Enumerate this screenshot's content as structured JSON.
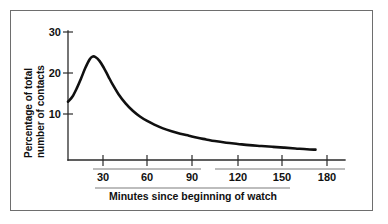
{
  "chart_data": {
    "type": "line",
    "title": "",
    "subtitle": "",
    "xlabel": "Minutes since beginning of watch",
    "ylabel": "Percentage of total number of contacts",
    "ylabel_line1": "Percentage of total",
    "ylabel_line2": "number of contacts",
    "xlim": [
      0,
      195
    ],
    "ylim": [
      0,
      30
    ],
    "grid": false,
    "legend": null,
    "legend_position": "none",
    "x_ticks": [
      30,
      60,
      90,
      120,
      150,
      180
    ],
    "x_tick_labels": [
      "30",
      "60",
      "90",
      "120",
      "150",
      "180"
    ],
    "y_ticks": [
      10,
      20,
      30
    ],
    "y_tick_labels": [
      "10",
      "20",
      "30"
    ],
    "series": [
      {
        "name": "Percentage of total number of contacts",
        "color": "#101010",
        "x": [
          0,
          3,
          6,
          9,
          12,
          15,
          17,
          19,
          22,
          25,
          28,
          31,
          35,
          40,
          45,
          50,
          55,
          60,
          66,
          72,
          78,
          84,
          90,
          96,
          102,
          110,
          118,
          126,
          134,
          142,
          150,
          158,
          166,
          172
        ],
        "values": [
          13.0,
          14.2,
          16.2,
          18.6,
          21.2,
          23.3,
          24.0,
          23.9,
          22.9,
          21.2,
          19.2,
          17.2,
          14.9,
          12.6,
          10.8,
          9.4,
          8.3,
          7.4,
          6.5,
          5.8,
          5.2,
          4.7,
          4.2,
          3.8,
          3.4,
          3.0,
          2.7,
          2.4,
          2.2,
          2.0,
          1.8,
          1.6,
          1.4,
          1.3
        ]
      }
    ],
    "annotations": [],
    "peak": {
      "x": 17,
      "y": 24.0
    },
    "start": {
      "x": 0,
      "y": 13.0
    },
    "end": {
      "x": 172,
      "y": 1.3
    }
  },
  "figure": {
    "border_color": "#6e6e6e",
    "background": "#ffffff",
    "curve_color": "#101010",
    "axis_color": "#2a2a2a"
  }
}
